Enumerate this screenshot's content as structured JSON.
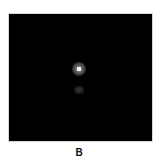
{
  "figure": {
    "panel_label": "B",
    "image_background": "#000000",
    "bright_spot_color": "#f4f4f4"
  }
}
